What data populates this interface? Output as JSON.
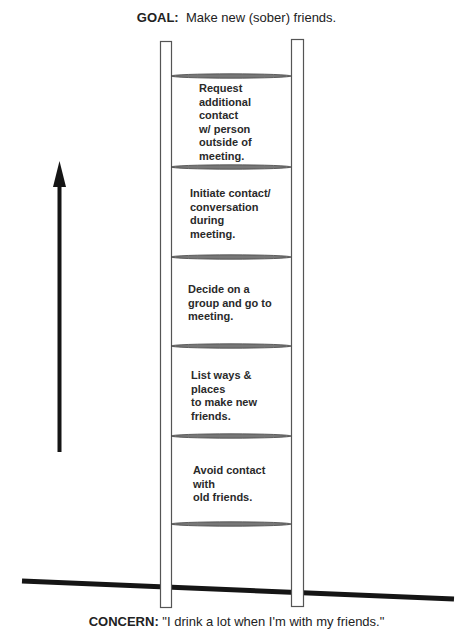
{
  "goal": {
    "label": "GOAL:",
    "text": "Make new (sober) friends."
  },
  "concern": {
    "label": "CONCERN:",
    "text": "\"I drink a lot when I'm with my friends.\""
  },
  "ladder": {
    "steps": [
      {
        "text": "Request\nadditional\ncontact\nw/ person\noutside of\nmeeting."
      },
      {
        "text": "Initiate contact/\nconversation\nduring\nmeeting."
      },
      {
        "text": "Decide on a\ngroup and go to\nmeeting."
      },
      {
        "text": "List ways &\nplaces\nto make new\nfriends."
      },
      {
        "text": "Avoid contact\nwith\nold friends."
      }
    ]
  },
  "arrow": {
    "direction": "up",
    "icon": "up-arrow-icon"
  },
  "colors": {
    "ink": "#1a1a1a",
    "rail": "#555555",
    "rung": "#777777"
  }
}
